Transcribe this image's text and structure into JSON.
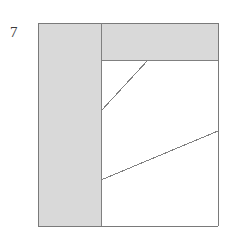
{
  "figure": {
    "label": "7",
    "caption": "",
    "background_color": "#ffffff",
    "fill_color": "#d9d9d9",
    "line_color": "#808080",
    "border_color": "#7a7a7a",
    "label_color": "#3a3a3a"
  },
  "chart_data": {
    "type": "diagram",
    "title": "7",
    "canvas": {
      "width": 229,
      "height": 237
    },
    "outer_rectangle": {
      "x": 38,
      "y": 23,
      "width": 180,
      "height": 203
    },
    "regions": [
      {
        "name": "left-column-shaded",
        "shading": "gray",
        "fill": "#d9d9d9",
        "points": [
          [
            38,
            23
          ],
          [
            101,
            23
          ],
          [
            101,
            226
          ],
          [
            38,
            226
          ]
        ]
      },
      {
        "name": "top-band-shaded",
        "shading": "gray",
        "fill": "#d9d9d9",
        "points": [
          [
            101,
            23
          ],
          [
            218,
            23
          ],
          [
            218,
            60
          ],
          [
            101,
            60
          ]
        ]
      },
      {
        "name": "interior-white",
        "shading": "white",
        "fill": "#ffffff",
        "points": [
          [
            101,
            60
          ],
          [
            218,
            60
          ],
          [
            218,
            226
          ],
          [
            101,
            226
          ]
        ]
      }
    ],
    "segments": [
      {
        "name": "outer-top-edge",
        "x1": 38,
        "y1": 23,
        "x2": 218,
        "y2": 23
      },
      {
        "name": "outer-right-edge",
        "x1": 218,
        "y1": 23,
        "x2": 218,
        "y2": 226
      },
      {
        "name": "outer-bottom-edge",
        "x1": 218,
        "y1": 226,
        "x2": 38,
        "y2": 226
      },
      {
        "name": "outer-left-edge",
        "x1": 38,
        "y1": 226,
        "x2": 38,
        "y2": 23
      },
      {
        "name": "vertical-divider",
        "x1": 101,
        "y1": 23,
        "x2": 101,
        "y2": 226
      },
      {
        "name": "horizontal-divider",
        "x1": 101,
        "y1": 60,
        "x2": 218,
        "y2": 60
      },
      {
        "name": "diagonal-upper",
        "x1": 101,
        "y1": 111,
        "x2": 148,
        "y2": 60
      },
      {
        "name": "diagonal-lower",
        "x1": 101,
        "y1": 180,
        "x2": 218,
        "y2": 131
      }
    ],
    "xlabel": "",
    "ylabel": "",
    "grid": false,
    "legend": null
  }
}
